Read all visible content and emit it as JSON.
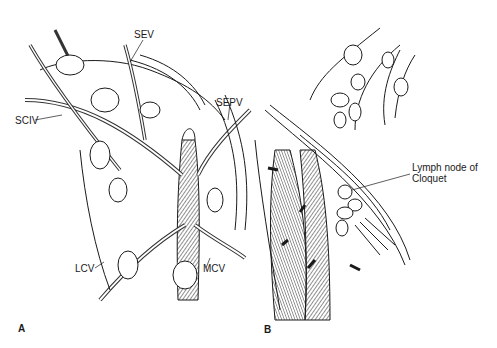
{
  "figure": {
    "type": "anatomical illustration",
    "panels": [
      {
        "id": "A",
        "label": "A",
        "annotations": [
          {
            "text": "SEV"
          },
          {
            "text": "SCIV"
          },
          {
            "text": "SEPV"
          },
          {
            "text": "LCV"
          },
          {
            "text": "MCV"
          }
        ]
      },
      {
        "id": "B",
        "label": "B",
        "annotations": [
          {
            "text": "Lymph node of Cloquet",
            "line1": "Lymph node of",
            "line2": "Cloquet"
          }
        ]
      }
    ]
  }
}
